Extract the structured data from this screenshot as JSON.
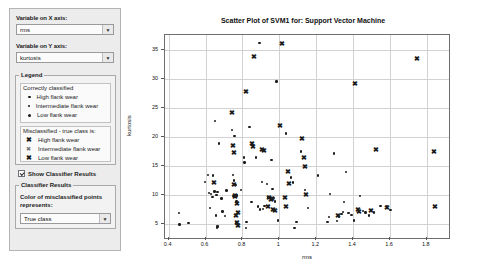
{
  "sidebar": {
    "x_axis": {
      "label": "Variable on X axis:",
      "value": "rms",
      "arrow": "chevron-down-icon"
    },
    "y_axis": {
      "label": "Variable on Y axis:",
      "value": "kurtosis",
      "arrow": "chevron-down-icon"
    },
    "legend": {
      "title": "Legend",
      "correct_heading": "Correctly classified",
      "correct_items": [
        {
          "marker": "dot-small",
          "label": "High flank wear"
        },
        {
          "marker": "dot-tiny",
          "label": "Intermediate flank wear"
        },
        {
          "marker": "dot-large",
          "label": "Low flank wear"
        }
      ],
      "misclassified_heading": "Misclassified - true class is:",
      "misclassified_items": [
        {
          "marker": "x-bold",
          "label": "High flank wear"
        },
        {
          "marker": "x-light",
          "label": "Intermediate flank wear"
        },
        {
          "marker": "x-bold",
          "label": "Low flank wear"
        }
      ]
    },
    "show_classifier_results": {
      "label": "Show Classifier Results",
      "checked": true
    },
    "classifier_results": {
      "title": "Classifier Results",
      "description_line1": "Color of misclassified points",
      "description_line2": "represents:",
      "dropdown_value": "True class",
      "arrow": "chevron-down-icon"
    }
  },
  "chart_data": {
    "type": "scatter",
    "title": "Scatter Plot of SVM1 for: Support Vector Machine",
    "xlabel": "rms",
    "ylabel": "kurtosis",
    "xlim": [
      0.38,
      1.92
    ],
    "ylim": [
      2.5,
      37.5
    ],
    "xticks": [
      0.4,
      0.6,
      0.8,
      1,
      1.2,
      1.4,
      1.6,
      1.8
    ],
    "xticklabels": [
      "0.4",
      "0.6",
      "0.8",
      "1",
      "1.2",
      "1.4",
      "1.6",
      "1.8"
    ],
    "yticks": [
      5,
      10,
      15,
      20,
      25,
      30,
      35
    ],
    "yticklabels": [
      "5",
      "10",
      "15",
      "20",
      "25",
      "30",
      "35"
    ],
    "grid": true,
    "legend_position": "external-left-panel",
    "series": [
      {
        "name": "Correctly classified",
        "marker": "dot",
        "color": "#1c1c1c",
        "points": [
          [
            0.455,
            6.8
          ],
          [
            0.458,
            4.8
          ],
          [
            0.508,
            5.1
          ],
          [
            0.598,
            12.2
          ],
          [
            0.614,
            13.4
          ],
          [
            0.62,
            10.3
          ],
          [
            0.624,
            7.7
          ],
          [
            0.631,
            10.1
          ],
          [
            0.638,
            9.6
          ],
          [
            0.641,
            13.3
          ],
          [
            0.648,
            10.5
          ],
          [
            0.652,
            22.7
          ],
          [
            0.655,
            6.4
          ],
          [
            0.659,
            9.9
          ],
          [
            0.661,
            4.6
          ],
          [
            0.663,
            4.3
          ],
          [
            0.665,
            10.4
          ],
          [
            0.668,
            4.5
          ],
          [
            0.672,
            18.8
          ],
          [
            0.686,
            9.3
          ],
          [
            0.691,
            7.1
          ],
          [
            0.705,
            6.3
          ],
          [
            0.713,
            10.7
          ],
          [
            0.742,
            21.1
          ],
          [
            0.748,
            13.4
          ],
          [
            0.751,
            9.7
          ],
          [
            0.754,
            12.4
          ],
          [
            0.757,
            20.1
          ],
          [
            0.762,
            11.6
          ],
          [
            0.765,
            5.0
          ],
          [
            0.768,
            8.8
          ],
          [
            0.772,
            9.8
          ],
          [
            0.791,
            10.8
          ],
          [
            0.808,
            16.4
          ],
          [
            0.812,
            15.5
          ],
          [
            0.818,
            4.2
          ],
          [
            0.822,
            5.3
          ],
          [
            0.839,
            21.6
          ],
          [
            0.848,
            8.7
          ],
          [
            0.872,
            16.4
          ],
          [
            0.885,
            7.9
          ],
          [
            0.892,
            36.1
          ],
          [
            0.896,
            7.4
          ],
          [
            0.905,
            12.2
          ],
          [
            0.912,
            7.5
          ],
          [
            0.92,
            8.0
          ],
          [
            0.932,
            11.8
          ],
          [
            0.942,
            9.5
          ],
          [
            0.958,
            16.0
          ],
          [
            0.962,
            11.0
          ],
          [
            0.97,
            9.4
          ],
          [
            0.978,
            8.8
          ],
          [
            0.985,
            29.5
          ],
          [
            0.992,
            5.5
          ],
          [
            1.035,
            20.5
          ],
          [
            1.062,
            12.9
          ],
          [
            1.075,
            12.1
          ],
          [
            1.082,
            4.2
          ],
          [
            1.092,
            5.3
          ],
          [
            1.118,
            17.4
          ],
          [
            1.138,
            10.8
          ],
          [
            1.155,
            7.7
          ],
          [
            1.21,
            13.3
          ],
          [
            1.262,
            5.3
          ],
          [
            1.268,
            6.1
          ],
          [
            1.275,
            10.1
          ],
          [
            1.298,
            17.1
          ],
          [
            1.312,
            5.4
          ],
          [
            1.325,
            6.2
          ],
          [
            1.338,
            6.6
          ],
          [
            1.345,
            7.0
          ],
          [
            1.352,
            8.7
          ],
          [
            1.362,
            13.9
          ],
          [
            1.375,
            6.8
          ],
          [
            1.392,
            6.5
          ],
          [
            1.405,
            5.5
          ],
          [
            1.438,
            9.7
          ],
          [
            1.452,
            7.2
          ],
          [
            1.468,
            6.9
          ],
          [
            1.485,
            6.4
          ],
          [
            1.512,
            6.9
          ],
          [
            1.548,
            8.0
          ],
          [
            1.585,
            7.9
          ],
          [
            1.602,
            7.3
          ]
        ]
      },
      {
        "name": "Misclassified - true class",
        "marker": "x",
        "color": "#1c1c1c",
        "points": [
          [
            0.646,
            12.2
          ],
          [
            0.742,
            24.2
          ],
          [
            0.748,
            18.6
          ],
          [
            0.752,
            17.3
          ],
          [
            0.756,
            11.8
          ],
          [
            0.758,
            10.0
          ],
          [
            0.761,
            9.8
          ],
          [
            0.765,
            6.4
          ],
          [
            0.768,
            5.2
          ],
          [
            0.772,
            8.5
          ],
          [
            0.775,
            7.0
          ],
          [
            0.778,
            4.7
          ],
          [
            0.82,
            27.9
          ],
          [
            0.852,
            18.9
          ],
          [
            0.856,
            18.4
          ],
          [
            0.862,
            33.9
          ],
          [
            0.908,
            17.8
          ],
          [
            0.915,
            17.6
          ],
          [
            0.938,
            8.1
          ],
          [
            0.946,
            9.5
          ],
          [
            0.955,
            9.2
          ],
          [
            0.962,
            9.4
          ],
          [
            0.968,
            7.5
          ],
          [
            0.975,
            7.4
          ],
          [
            1.005,
            21.9
          ],
          [
            1.012,
            36.2
          ],
          [
            1.028,
            9.5
          ],
          [
            1.038,
            8.1
          ],
          [
            1.048,
            14.1
          ],
          [
            1.055,
            12.0
          ],
          [
            1.125,
            19.7
          ],
          [
            1.132,
            16.5
          ],
          [
            1.138,
            14.9
          ],
          [
            1.145,
            10.1
          ],
          [
            1.318,
            6.5
          ],
          [
            1.408,
            29.2
          ],
          [
            1.428,
            7.5
          ],
          [
            1.432,
            7.2
          ],
          [
            1.495,
            7.3
          ],
          [
            1.522,
            17.9
          ],
          [
            1.585,
            7.9
          ],
          [
            1.748,
            33.6
          ],
          [
            1.838,
            17.5
          ],
          [
            1.845,
            8.1
          ]
        ]
      }
    ]
  }
}
